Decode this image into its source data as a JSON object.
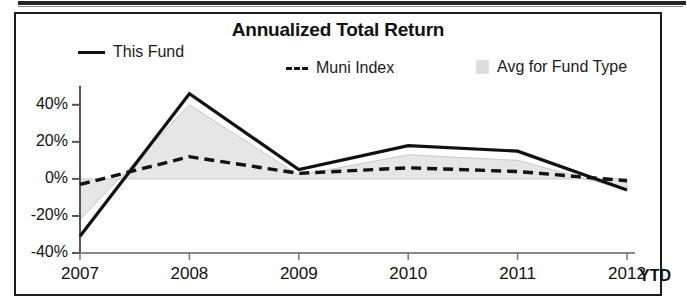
{
  "panel": {
    "title": "Annualized Total Return"
  },
  "legend": {
    "position": "top",
    "items": [
      {
        "id": "this-fund",
        "label": "This Fund",
        "marker": "solid-line",
        "color": "#111111"
      },
      {
        "id": "muni-index",
        "label": "Muni Index",
        "marker": "dashed-line",
        "color": "#111111"
      },
      {
        "id": "avg-for-fund-type",
        "label": "Avg for Fund Type",
        "marker": "filled-area",
        "color": "#dddddd"
      }
    ]
  },
  "axis": {
    "x_suffix_label": "YTD"
  },
  "chart_data": {
    "type": "line",
    "title": "Annualized Total Return",
    "xlabel": "",
    "ylabel": "",
    "x": [
      "2007",
      "2008",
      "2009",
      "2010",
      "2011",
      "2012"
    ],
    "xtick_labels": [
      "2007",
      "2008",
      "2009",
      "2010",
      "2011",
      "2012"
    ],
    "ytick_labels": [
      "40%",
      "20%",
      "0%",
      "-20%",
      "-40%"
    ],
    "ytick_values": [
      40,
      20,
      0,
      -20,
      -40
    ],
    "ylim": [
      -40,
      48
    ],
    "grid": false,
    "legend_position": "top",
    "series": [
      {
        "name": "This Fund",
        "style": "solid",
        "color": "#111111",
        "values": [
          -31,
          46,
          5,
          18,
          15,
          -6
        ]
      },
      {
        "name": "Muni Index",
        "style": "dashed",
        "color": "#111111",
        "values": [
          -3,
          12,
          3,
          6,
          4,
          -1
        ]
      },
      {
        "name": "Avg for Fund Type",
        "style": "filled-area",
        "color": "#dddddd",
        "values": [
          -22,
          40,
          2,
          13,
          10,
          -6
        ]
      }
    ]
  }
}
